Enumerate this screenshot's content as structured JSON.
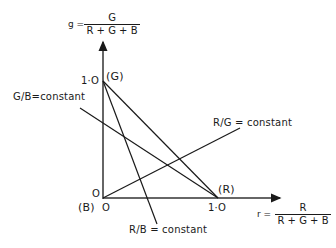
{
  "axes": {
    "y_axis": {
      "var": "g =",
      "numerator": "G",
      "denominator": "R + G + B"
    },
    "x_axis": {
      "var": "r =",
      "numerator": "R",
      "denominator": "R + G + B"
    }
  },
  "points": {
    "g_tick": "1·O",
    "g_point": "(G)",
    "origin_label": "(B)",
    "origin_tick_x": "O",
    "origin_tick_y": "O",
    "r_tick": "1·O",
    "r_point": "(R)"
  },
  "lines": {
    "g_over_b": "G/B=constant",
    "r_over_g": "R/G = constant",
    "r_over_b": "R/B = constant"
  },
  "colors": {
    "ink": "#1a1a1a",
    "background": "#ffffff"
  }
}
